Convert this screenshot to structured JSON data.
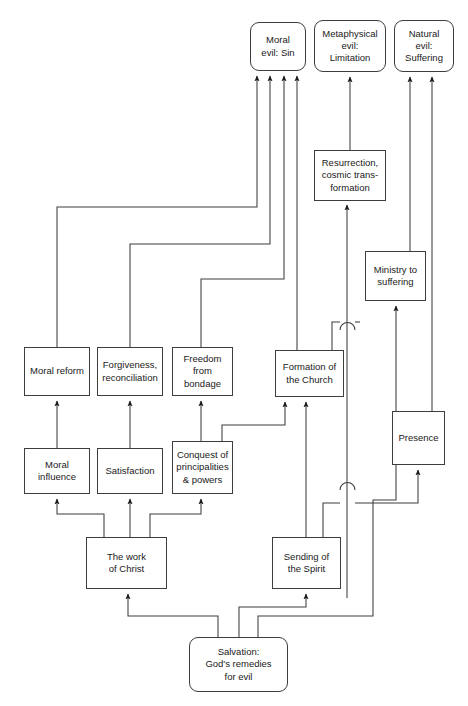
{
  "diagram": {
    "type": "flowchart",
    "stroke_color": "#3d3d3d",
    "text_color": "#1a1a1a",
    "background": "#ffffff",
    "nodes": [
      {
        "id": "moral_evil",
        "label": "Moral\nevil: Sin",
        "shape": "rounded",
        "x": 250,
        "y": 22,
        "w": 56,
        "h": 49
      },
      {
        "id": "metaphysical_evil",
        "label": "Metaphysical\nevil:\nLimitation",
        "shape": "rounded",
        "x": 314,
        "y": 20,
        "w": 72,
        "h": 52
      },
      {
        "id": "natural_evil",
        "label": "Natural\nevil:\nSuffering",
        "shape": "rounded",
        "x": 394,
        "y": 20,
        "w": 60,
        "h": 52
      },
      {
        "id": "resurrection",
        "label": "Resurrection,\ncosmic trans-\nformation",
        "shape": "rect",
        "x": 314,
        "y": 150,
        "w": 72,
        "h": 51
      },
      {
        "id": "ministry",
        "label": "Ministry to\nsuffering",
        "shape": "rect",
        "x": 365,
        "y": 251,
        "w": 61,
        "h": 50
      },
      {
        "id": "moral_reform",
        "label": "Moral reform",
        "shape": "rect",
        "x": 24,
        "y": 347,
        "w": 66,
        "h": 49
      },
      {
        "id": "forgiveness",
        "label": "Forgiveness,\nreconciliation",
        "shape": "rect",
        "x": 97,
        "y": 347,
        "w": 66,
        "h": 49
      },
      {
        "id": "freedom",
        "label": "Freedom\nfrom\nbondage",
        "shape": "rect",
        "x": 172,
        "y": 347,
        "w": 61,
        "h": 49
      },
      {
        "id": "formation",
        "label": "Formation of\nthe Church",
        "shape": "rect",
        "x": 275,
        "y": 350,
        "w": 69,
        "h": 47
      },
      {
        "id": "presence",
        "label": "Presence",
        "shape": "rect",
        "x": 392,
        "y": 411,
        "w": 53,
        "h": 54
      },
      {
        "id": "moral_influence",
        "label": "Moral\ninfluence",
        "shape": "rect",
        "x": 24,
        "y": 448,
        "w": 66,
        "h": 46
      },
      {
        "id": "satisfaction",
        "label": "Satisfaction",
        "shape": "rect",
        "x": 97,
        "y": 448,
        "w": 66,
        "h": 46
      },
      {
        "id": "conquest",
        "label": "Conquest of\nprincipalities\n& powers",
        "shape": "rect",
        "x": 172,
        "y": 441,
        "w": 61,
        "h": 53
      },
      {
        "id": "work_of_christ",
        "label": "The work\nof Christ",
        "shape": "rect",
        "x": 86,
        "y": 537,
        "w": 81,
        "h": 52
      },
      {
        "id": "sending_spirit",
        "label": "Sending of\nthe Spirit",
        "shape": "rect",
        "x": 272,
        "y": 537,
        "w": 69,
        "h": 52
      },
      {
        "id": "salvation",
        "label": "Salvation:\nGod's remedies\nfor evil",
        "shape": "rounded",
        "x": 189,
        "y": 637,
        "w": 99,
        "h": 55
      }
    ],
    "edges": [
      {
        "from": "moral_reform",
        "to": "moral_evil",
        "style": "elbow"
      },
      {
        "from": "forgiveness",
        "to": "moral_evil",
        "style": "elbow"
      },
      {
        "from": "freedom",
        "to": "moral_evil",
        "style": "elbow"
      },
      {
        "from": "formation",
        "to": "moral_evil",
        "style": "straight"
      },
      {
        "from": "resurrection",
        "to": "metaphysical_evil",
        "style": "straight"
      },
      {
        "from": "ministry",
        "to": "natural_evil",
        "style": "straight"
      },
      {
        "from": "presence",
        "to": "natural_evil",
        "style": "straight"
      },
      {
        "from": "formation",
        "to": "resurrection",
        "style": "straight"
      },
      {
        "from": "moral_influence",
        "to": "moral_reform",
        "style": "straight"
      },
      {
        "from": "satisfaction",
        "to": "forgiveness",
        "style": "straight"
      },
      {
        "from": "conquest",
        "to": "freedom",
        "style": "straight"
      },
      {
        "from": "conquest",
        "to": "formation",
        "style": "elbow"
      },
      {
        "from": "sending_spirit",
        "to": "formation",
        "style": "straight"
      },
      {
        "from": "sending_spirit",
        "to": "presence",
        "style": "elbow-hop"
      },
      {
        "from": "work_of_christ",
        "to": "moral_influence",
        "style": "elbow"
      },
      {
        "from": "work_of_christ",
        "to": "satisfaction",
        "style": "straight"
      },
      {
        "from": "work_of_christ",
        "to": "conquest",
        "style": "elbow"
      },
      {
        "from": "salvation",
        "to": "work_of_christ",
        "style": "elbow"
      },
      {
        "from": "salvation",
        "to": "sending_spirit",
        "style": "elbow"
      },
      {
        "from": "salvation",
        "to": "ministry",
        "style": "elbow-hop"
      }
    ]
  }
}
